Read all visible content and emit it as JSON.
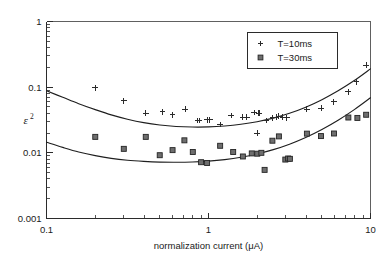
{
  "chart_data": {
    "type": "scatter",
    "title": "",
    "xlabel": "normalization current (μA)",
    "ylabel": "ε²",
    "ylabel_base": "ε",
    "ylabel_exponent": "2",
    "xscale": "log",
    "yscale": "log",
    "xlim": [
      0.1,
      10
    ],
    "ylim": [
      0.001,
      1
    ],
    "grid": false,
    "xticks": [
      0.1,
      1,
      10
    ],
    "xtick_labels": [
      "0.1",
      "1",
      "10"
    ],
    "yticks": [
      0.001,
      0.01,
      0.1,
      1
    ],
    "ytick_labels": [
      "0.001",
      "0.01",
      "0.1",
      "1"
    ],
    "legend_position": "upper right",
    "series": [
      {
        "name": "T=10ms",
        "marker": "plus",
        "color": "#2b2b2b",
        "points": [
          [
            0.2,
            0.098
          ],
          [
            0.3,
            0.062
          ],
          [
            0.41,
            0.04
          ],
          [
            0.52,
            0.042
          ],
          [
            0.6,
            0.038
          ],
          [
            0.72,
            0.046
          ],
          [
            0.86,
            0.031
          ],
          [
            0.88,
            0.031
          ],
          [
            0.98,
            0.032
          ],
          [
            1.02,
            0.032
          ],
          [
            1.18,
            0.027
          ],
          [
            1.38,
            0.037
          ],
          [
            1.62,
            0.035
          ],
          [
            1.72,
            0.035
          ],
          [
            1.92,
            0.041
          ],
          [
            2.0,
            0.02
          ],
          [
            2.05,
            0.04
          ],
          [
            2.28,
            0.031
          ],
          [
            2.48,
            0.034
          ],
          [
            2.62,
            0.035
          ],
          [
            2.72,
            0.036
          ],
          [
            2.88,
            0.035
          ],
          [
            3.05,
            0.034
          ],
          [
            4.05,
            0.046
          ],
          [
            4.95,
            0.048
          ],
          [
            5.95,
            0.06
          ],
          [
            7.3,
            0.085
          ],
          [
            8.2,
            0.12
          ],
          [
            9.4,
            0.215
          ]
        ]
      },
      {
        "name": "T=30ms",
        "marker": "square",
        "color": "#6e6e6e",
        "points": [
          [
            0.2,
            0.0175
          ],
          [
            0.3,
            0.0115
          ],
          [
            0.41,
            0.0175
          ],
          [
            0.5,
            0.0092
          ],
          [
            0.6,
            0.011
          ],
          [
            0.71,
            0.0155
          ],
          [
            0.8,
            0.0103
          ],
          [
            0.9,
            0.0072
          ],
          [
            0.98,
            0.007
          ],
          [
            1.18,
            0.0128
          ],
          [
            1.42,
            0.0103
          ],
          [
            1.63,
            0.0088
          ],
          [
            1.85,
            0.0098
          ],
          [
            2.0,
            0.0097
          ],
          [
            2.12,
            0.01
          ],
          [
            2.22,
            0.0055
          ],
          [
            2.48,
            0.0153
          ],
          [
            2.72,
            0.0178
          ],
          [
            2.98,
            0.0079
          ],
          [
            3.1,
            0.0082
          ],
          [
            3.18,
            0.0081
          ],
          [
            4.05,
            0.0196
          ],
          [
            4.95,
            0.018
          ],
          [
            5.95,
            0.0197
          ],
          [
            7.3,
            0.0345
          ],
          [
            8.3,
            0.034
          ],
          [
            9.4,
            0.038
          ]
        ]
      }
    ],
    "fit_curves": [
      {
        "name": "T=10ms fit",
        "points": [
          [
            0.1,
            0.088
          ],
          [
            0.126,
            0.07
          ],
          [
            0.158,
            0.056
          ],
          [
            0.2,
            0.0455
          ],
          [
            0.251,
            0.0378
          ],
          [
            0.316,
            0.0325
          ],
          [
            0.398,
            0.0288
          ],
          [
            0.501,
            0.0265
          ],
          [
            0.631,
            0.0252
          ],
          [
            0.794,
            0.0247
          ],
          [
            1.0,
            0.0248
          ],
          [
            1.259,
            0.0256
          ],
          [
            1.585,
            0.0272
          ],
          [
            1.995,
            0.0298
          ],
          [
            2.512,
            0.0338
          ],
          [
            3.162,
            0.04
          ],
          [
            3.981,
            0.0495
          ],
          [
            5.012,
            0.0645
          ],
          [
            6.31,
            0.088
          ],
          [
            7.943,
            0.126
          ],
          [
            10.0,
            0.19
          ]
        ]
      },
      {
        "name": "T=30ms fit",
        "points": [
          [
            0.1,
            0.0145
          ],
          [
            0.126,
            0.0121
          ],
          [
            0.158,
            0.0103
          ],
          [
            0.2,
            0.00905
          ],
          [
            0.251,
            0.00822
          ],
          [
            0.316,
            0.0077
          ],
          [
            0.398,
            0.0074
          ],
          [
            0.501,
            0.00722
          ],
          [
            0.631,
            0.00718
          ],
          [
            0.794,
            0.00725
          ],
          [
            1.0,
            0.00748
          ],
          [
            1.259,
            0.0079
          ],
          [
            1.585,
            0.00858
          ],
          [
            1.995,
            0.00962
          ],
          [
            2.512,
            0.01118
          ],
          [
            3.162,
            0.01355
          ],
          [
            3.981,
            0.01715
          ],
          [
            5.012,
            0.0227
          ],
          [
            6.31,
            0.0314
          ],
          [
            7.943,
            0.0455
          ],
          [
            10.0,
            0.069
          ]
        ]
      }
    ]
  },
  "legend": {
    "entries": [
      {
        "label": "T=10ms",
        "marker": "plus"
      },
      {
        "label": "T=30ms",
        "marker": "square"
      }
    ]
  }
}
